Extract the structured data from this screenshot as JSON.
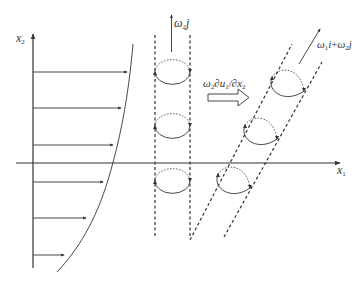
{
  "diagram": {
    "type": "vortex tilting schematic in shear flow",
    "axes": {
      "x_axis_label": "x",
      "x_axis_sub": "1",
      "y_axis_label": "x",
      "y_axis_sub": "2"
    },
    "velocity_profile": {
      "arrow_count": 6,
      "description": "Horizontal velocity vectors increasing with height x2"
    },
    "vertical_tube": {
      "vorticity_label": "ω",
      "vorticity_sub": "2",
      "vorticity_unit": "j",
      "vortex_loops": 3
    },
    "tilting_term": {
      "label_omega": "ω",
      "label_omega_sub": "2",
      "label_rest": "∂u",
      "label_u_sub": "1",
      "label_den": "/∂x",
      "label_den_sub": "2"
    },
    "tilted_tube": {
      "label_a": "ω",
      "label_a_sub": "1",
      "label_a_unit": "i",
      "label_plus": "+",
      "label_b": "ω",
      "label_b_sub": "2",
      "label_b_unit": "j",
      "vortex_loops": 3
    },
    "colors": {
      "line": "#333333",
      "dashed": "#333333",
      "background": "#ffffff"
    }
  }
}
